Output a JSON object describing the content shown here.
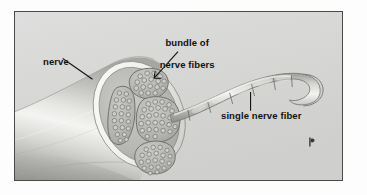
{
  "figure": {
    "background_color": "#d8d8d6",
    "frame_color": "#4a4a4a",
    "ink_color": "#111111",
    "artist_mark": "signature"
  },
  "labels": {
    "bundle": "bundle of\nnerve fibers",
    "bundle_line1": "bundle of",
    "bundle_line2": "nerve fibers",
    "nerve": "nerve",
    "single_fiber": "single nerve fiber"
  },
  "anatomy": {
    "nerve_trunk": {
      "name": "nerve trunk",
      "shading": "grayscale cylindrical gradient",
      "fill_light": "#f2f2f0",
      "fill_mid": "#c9c9c6",
      "fill_dark": "#9b9b98"
    },
    "cross_section": {
      "name": "nerve cross-section",
      "shape": "ellipse",
      "rim_color": "#f5f5f3",
      "interior_color": "#b9b9b6",
      "fascicle_count": 4
    },
    "fascicles": [
      {
        "name": "fascicle-top",
        "fiber_count": 17
      },
      {
        "name": "fascicle-left",
        "fiber_count": 22
      },
      {
        "name": "fascicle-center",
        "fiber_count": 28
      },
      {
        "name": "fascicle-bottom",
        "fiber_count": 20
      }
    ],
    "single_fiber": {
      "name": "single myelinated nerve fiber",
      "segment_count": 7,
      "description": "segmented myelinated axon curving right and hooking back"
    }
  },
  "leaders": {
    "bundle_leader": "arrow from label to top fascicle",
    "nerve_leader": "line from label to nerve trunk surface",
    "single_fiber_leader": "vertical line from label to fiber segment"
  }
}
